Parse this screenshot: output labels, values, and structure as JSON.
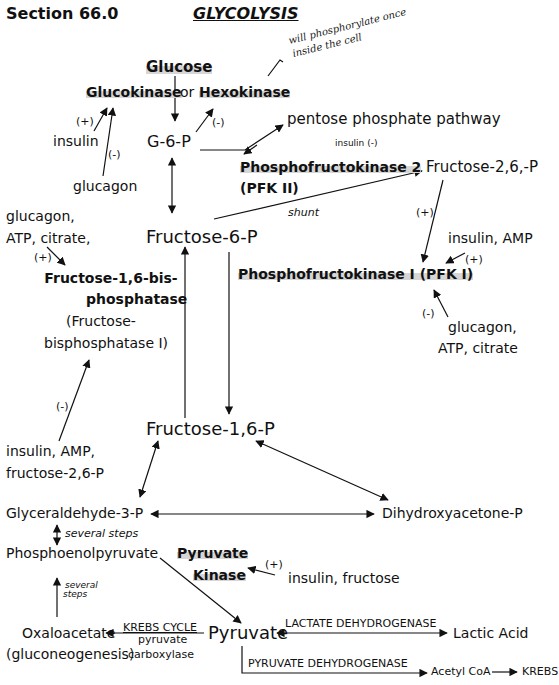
{
  "header": {
    "section": "Section 66.0",
    "title": "GLYCOLYSIS"
  },
  "annotation": {
    "handwritten_line1": "will phosphorylate once",
    "handwritten_line2": "inside the cell"
  },
  "nodes": {
    "glucose": "Glucose",
    "glucokinase": "Glucokinase",
    "or": "or",
    "hexokinase": "Hexokinase",
    "g6p": "G-6-P",
    "pentose": "pentose phosphate pathway",
    "pfk2_line1": "Phosphofructokinase 2",
    "pfk2_line2": "(PFK II)",
    "f26p": "Fructose-2,6,-P",
    "shunt": "shunt",
    "f6p": "Fructose-6-P",
    "pfk1": "Phosphofructokinase I (PFK I)",
    "fbpase_line1": "Fructose-1,6-bis-",
    "fbpase_line2": "phosphatase",
    "fbpase_line3": "(Fructose-",
    "fbpase_line4": "bisphosphatase I)",
    "f16p": "Fructose-1,6-P",
    "g3p": "Glyceraldehyde-3-P",
    "dhap": "Dihydroxyacetone-P",
    "several_steps_1": "several steps",
    "pep": "Phosphoenolpyruvate",
    "pk_line1": "Pyruvate",
    "pk_line2": "Kinase",
    "several_steps_2a": "several",
    "several_steps_2b": "steps",
    "oaa": "Oxaloacetate",
    "gluconeo": "(gluconeogenesis)",
    "krebs_cycle_label": "KREBS CYCLE",
    "pyruvate_carboxylase_1": "pyruvate",
    "pyruvate_carboxylase_2": "carboxylase",
    "pyruvate": "Pyruvate",
    "ldh": "LACTATE DEHYDROGENASE",
    "lactic": "Lactic Acid",
    "pdh": "PYRUVATE DEHYDROGENASE",
    "acetyl_coa": "Acetyl CoA",
    "krebs": "KREBS"
  },
  "regulators": {
    "gk_plus": "(+)",
    "gk_insulin": "insulin",
    "gk_minus": "(-)",
    "gk_glucagon": "glucagon",
    "hk_minus": "(-)",
    "pfk2_insulin": "insulin (-)",
    "fbp_reg_line1": "glucagon,",
    "fbp_reg_line2": "ATP, citrate,",
    "fbp_plus": "(+)",
    "f26p_plus": "(+)",
    "pfk1_act": "insulin, AMP",
    "pfk1_plus": "(+)",
    "pfk1_minus": "(-)",
    "pfk1_inh_line1": "glucagon,",
    "pfk1_inh_line2": "ATP, citrate",
    "fbp_minus": "(-)",
    "fbp_inh_line1": "insulin, AMP,",
    "fbp_inh_line2": "fructose-2,6-P",
    "pk_plus": "(+)",
    "pk_act": "insulin, fructose"
  },
  "colors": {
    "ink": "#111111",
    "highlight": "#d6d6d6",
    "background": "#ffffff"
  }
}
